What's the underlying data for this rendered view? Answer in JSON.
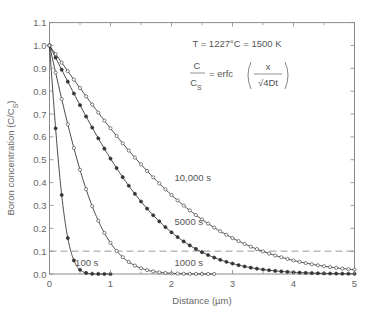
{
  "chart_data": {
    "type": "line",
    "title": "",
    "xlabel": "Distance (µm)",
    "ylabel": "Boron concentration (C/C",
    "ylabel_sub": "S",
    "ylabel_close": ")",
    "xlim": [
      0,
      5
    ],
    "ylim": [
      0.0,
      1.1
    ],
    "xticks": [
      0,
      1,
      2,
      3,
      4,
      5
    ],
    "xtick_labels": [
      "0",
      "1",
      "2",
      "3",
      "4",
      "5"
    ],
    "yticks": [
      0.0,
      0.1,
      0.2,
      0.3,
      0.4,
      0.5,
      0.6,
      0.7,
      0.8,
      0.9,
      1.0,
      1.1
    ],
    "ytick_labels": [
      "0.0",
      "0.1",
      "0.2",
      "0.3",
      "0.4",
      "0.5",
      "0.6",
      "0.7",
      "0.8",
      "0.9",
      "1.0",
      "1.1"
    ],
    "grid": false,
    "reference_line": {
      "y": 0.1,
      "style": "dashed"
    },
    "annotations": {
      "temperature": "T = 1227°C = 1500 K",
      "equation_lhs_num": "C",
      "equation_lhs_den": "C",
      "equation_lhs_den_sub": "S",
      "equation_eq": "= erfc",
      "equation_frac_num": "x",
      "equation_frac_den": "√4Dt"
    },
    "diffusivity_um2_per_s": 0.000225,
    "series": [
      {
        "name": "100 s",
        "time_s": 100,
        "marker": "filled",
        "x_step": 0.1,
        "x_max": 1.0,
        "x": [
          0,
          0.1,
          0.2,
          0.3,
          0.4,
          0.5,
          0.6,
          0.7,
          0.8,
          0.9,
          1.0
        ],
        "values": [
          1.0,
          0.64,
          0.35,
          0.16,
          0.06,
          0.02,
          0.005,
          0.001,
          0.0,
          0.0,
          0.0
        ],
        "label_pos": [
          0.42,
          0.035
        ]
      },
      {
        "name": "1000 s",
        "time_s": 1000,
        "marker": "open",
        "x_step": 0.1,
        "x_max": 2.7,
        "x": [
          0,
          0.2,
          0.4,
          0.6,
          0.8,
          1.0,
          1.2,
          1.4,
          1.6,
          1.8,
          2.0,
          2.2,
          2.4,
          2.6
        ],
        "values": [
          1.0,
          0.77,
          0.55,
          0.37,
          0.23,
          0.14,
          0.07,
          0.04,
          0.02,
          0.01,
          0.003,
          0.001,
          0.0,
          0.0
        ],
        "label_pos": [
          2.05,
          0.035
        ]
      },
      {
        "name": "5000 s",
        "time_s": 5000,
        "marker": "filled",
        "x_step": 0.1,
        "x_max": 5.0,
        "x": [
          0,
          0.5,
          1.0,
          1.5,
          2.0,
          2.5,
          3.0,
          3.5,
          4.0,
          4.5,
          5.0
        ],
        "values": [
          1.0,
          0.74,
          0.5,
          0.32,
          0.18,
          0.1,
          0.05,
          0.02,
          0.008,
          0.003,
          0.001
        ],
        "label_pos": [
          2.05,
          0.215
        ]
      },
      {
        "name": "10,000 s",
        "time_s": 10000,
        "marker": "open",
        "x_step": 0.1,
        "x_max": 5.0,
        "x": [
          0,
          0.5,
          1.0,
          1.5,
          2.0,
          2.5,
          3.0,
          3.5,
          4.0,
          4.5,
          5.0
        ],
        "values": [
          1.0,
          0.81,
          0.64,
          0.48,
          0.35,
          0.24,
          0.16,
          0.1,
          0.06,
          0.03,
          0.02
        ],
        "label_pos": [
          2.05,
          0.405
        ]
      }
    ]
  }
}
